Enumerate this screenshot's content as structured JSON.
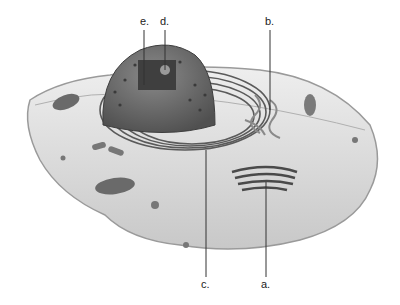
{
  "diagram": {
    "labels": [
      {
        "id": "a",
        "text": "a.",
        "points_to": "golgi apparatus"
      },
      {
        "id": "b",
        "text": "b.",
        "points_to": "smooth endoplasmic reticulum"
      },
      {
        "id": "c",
        "text": "c.",
        "points_to": "rough endoplasmic reticulum"
      },
      {
        "id": "d",
        "text": "d.",
        "points_to": "nucleolus"
      },
      {
        "id": "e",
        "text": "e.",
        "points_to": "chromatin"
      }
    ],
    "colors": {
      "background": "#ffffff",
      "cell_body": "#d9d9d9",
      "cell_edge": "#9a9a9a",
      "nucleus": "#6e6e6e",
      "nucleus_dark": "#4a4a4a",
      "organelle": "#5a5a5a",
      "leader_line": "#333333"
    }
  }
}
